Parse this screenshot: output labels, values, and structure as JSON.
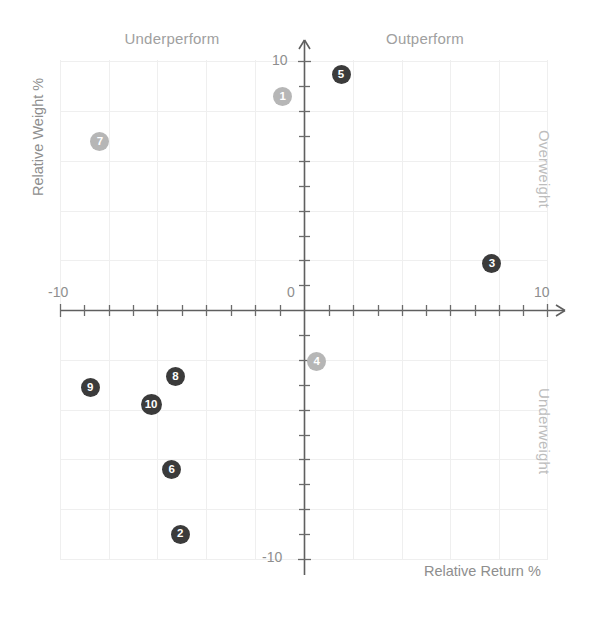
{
  "chart_data": {
    "type": "scatter",
    "title": "",
    "xlabel": "Relative Return %",
    "ylabel": "Relative Weight %",
    "xlim": [
      -10,
      10
    ],
    "ylim": [
      -10,
      10
    ],
    "xticks": [
      "-10",
      "0",
      "10"
    ],
    "yticks": [
      "10",
      "-10"
    ],
    "grid": true,
    "legend": "none",
    "quadrant_labels": {
      "top_left": "Underperform",
      "top_right": "Outperform",
      "right_upper": "Overweight",
      "right_lower": "Underweight"
    },
    "colors": {
      "dark_marker": "#3b3b3b",
      "light_marker": "#b6b6b6",
      "axis": "#5a5a5a",
      "grid": "#eeeeee",
      "text": "#8e8e8e",
      "quadrant_text": "#a0a0a0"
    },
    "points": [
      {
        "label": "5",
        "x": 1.5,
        "y": 9.5,
        "shade": "dark"
      },
      {
        "label": "1",
        "x": -0.9,
        "y": 8.6,
        "shade": "light"
      },
      {
        "label": "7",
        "x": -8.4,
        "y": 6.8,
        "shade": "light"
      },
      {
        "label": "3",
        "x": 7.7,
        "y": 1.9,
        "shade": "dark"
      },
      {
        "label": "4",
        "x": 0.5,
        "y": -2.05,
        "shade": "light"
      },
      {
        "label": "8",
        "x": -5.3,
        "y": -2.65,
        "shade": "dark"
      },
      {
        "label": "9",
        "x": -8.8,
        "y": -3.1,
        "shade": "dark"
      },
      {
        "label": "10",
        "x": -6.3,
        "y": -3.8,
        "shade": "dark"
      },
      {
        "label": "6",
        "x": -5.45,
        "y": -6.4,
        "shade": "dark"
      },
      {
        "label": "2",
        "x": -5.1,
        "y": -9.0,
        "shade": "dark"
      }
    ]
  },
  "axes": {
    "x_tick_min": "-10",
    "x_tick_zero": "0",
    "x_tick_max": "10",
    "y_tick_max": "10",
    "y_tick_min": "-10",
    "x_title": "Relative Return %",
    "y_title": "Relative Weight %"
  },
  "quadrants": {
    "underperform": "Underperform",
    "outperform": "Outperform",
    "overweight": "Overweight",
    "underweight": "Underweight"
  }
}
